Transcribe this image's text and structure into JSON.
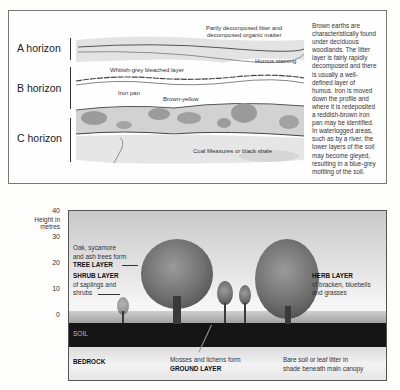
{
  "soil_profile": {
    "horizons": [
      {
        "label": "A horizon"
      },
      {
        "label": "B horizon"
      },
      {
        "label": "C horizon"
      }
    ],
    "annotations": {
      "litter": "Partly decomposed litter and decomposed organic matter",
      "litter_line1": "Partly decomposed litter and",
      "litter_line2": "decomposed organic matter",
      "humus": "Humus staining",
      "bleached": "Whitish-grey bleached layer",
      "iron_pan": "Iron pan",
      "brown_yellow": "Brown-yellow",
      "bedrock": "Coal Measures or black shale"
    },
    "description_lines": [
      "Brown earths are",
      "characteristically found",
      "under deciduous",
      "woodlands. The litter",
      "layer is fairly rapidly",
      "decomposed and there",
      "is usually a well-",
      "defined layer of",
      "humus. Iron is moved",
      "down the profile and",
      "where it is redeposited",
      "a reddish-brown iron",
      "pan may be identified.",
      "In waterlogged areas,",
      "such as by a river, the",
      "lower layers of the soil",
      "may become gleyed,",
      "resulting in a blue-grey",
      "mottling of the soil."
    ]
  },
  "woodland_structure": {
    "axis": {
      "label_line1": "Height in",
      "label_line2": "metres",
      "ticks": [
        "40",
        "30",
        "20",
        "10",
        "0"
      ]
    },
    "labels": {
      "tree_line1": "Oak, sycamore",
      "tree_line2": "and ash trees form",
      "tree_title": "TREE LAYER",
      "shrub_title": "SHRUB LAYER",
      "shrub_line1": "of saplings and",
      "shrub_line2": "shrubs",
      "herb_title": "HERB LAYER",
      "herb_line1": "of bracken, bluebells",
      "herb_line2": "and grasses",
      "soil": "SOIL",
      "bedrock": "BEDROCK",
      "ground_line1": "Mosses and lichens form",
      "ground_title": "GROUND LAYER",
      "bare_line1": "Bare soil or leaf litter in",
      "bare_line2": "shade beneath main canopy"
    }
  }
}
